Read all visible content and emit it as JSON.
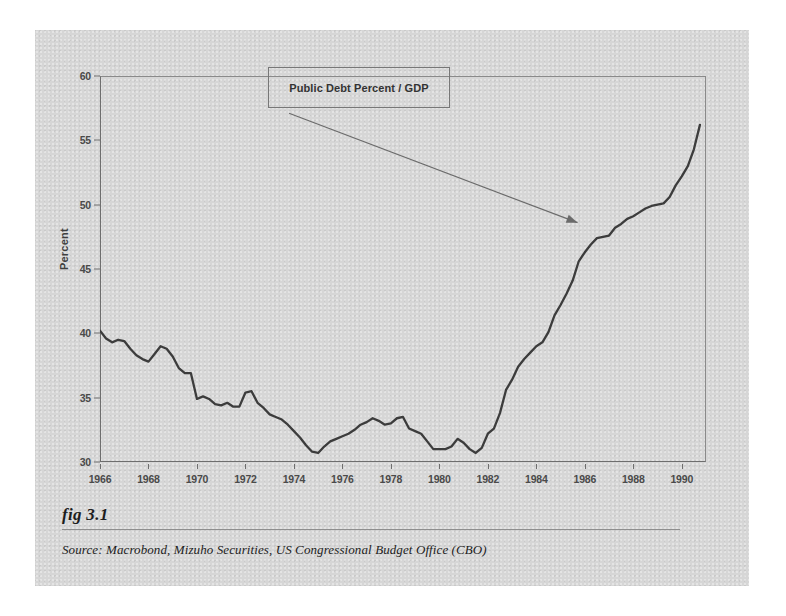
{
  "figure": {
    "number_label": "fig 3.1",
    "source_text": "Source:  Macrobond, Mizuho Securities, US Congressional Budget Office (CBO)",
    "panel_background": "#d6d6d6",
    "line_color": "#3c3c3c",
    "axis_color": "#6e6e6e"
  },
  "annotation": {
    "series_box_label": "Public Debt Percent / GDP",
    "arrow_name": "callout-arrow"
  },
  "chart_data": {
    "type": "line",
    "title": "",
    "subtitle": "",
    "xlabel": "",
    "ylabel": "Percent",
    "xlim": [
      1966.0,
      1991.0
    ],
    "ylim": [
      30,
      60
    ],
    "grid": false,
    "legend_position": "inside-top-center",
    "y_ticks": [
      30,
      35,
      40,
      45,
      50,
      55,
      60
    ],
    "y_tick_labels": [
      "30",
      "35",
      "40",
      "45",
      "50",
      "55",
      "60"
    ],
    "x_ticks": [
      1966,
      1968,
      1970,
      1972,
      1974,
      1976,
      1978,
      1980,
      1982,
      1984,
      1986,
      1988,
      1990
    ],
    "x_tick_labels": [
      "1966",
      "1968",
      "1970",
      "1972",
      "1974",
      "1976",
      "1978",
      "1980",
      "1982",
      "1984",
      "1986",
      "1988",
      "1990"
    ],
    "series": [
      {
        "name": "Public Debt Percent / GDP",
        "color": "#3c3c3c",
        "x": [
          1966.0,
          1966.25,
          1966.5,
          1966.75,
          1967.0,
          1967.25,
          1967.5,
          1967.75,
          1968.0,
          1968.25,
          1968.5,
          1968.75,
          1969.0,
          1969.25,
          1969.5,
          1969.75,
          1970.0,
          1970.25,
          1970.5,
          1970.75,
          1971.0,
          1971.25,
          1971.5,
          1971.75,
          1972.0,
          1972.25,
          1972.5,
          1972.75,
          1973.0,
          1973.25,
          1973.5,
          1973.75,
          1974.0,
          1974.25,
          1974.5,
          1974.75,
          1975.0,
          1975.25,
          1975.5,
          1975.75,
          1976.0,
          1976.25,
          1976.5,
          1976.75,
          1977.0,
          1977.25,
          1977.5,
          1977.75,
          1978.0,
          1978.25,
          1978.5,
          1978.75,
          1979.0,
          1979.25,
          1979.5,
          1979.75,
          1980.0,
          1980.25,
          1980.5,
          1980.75,
          1981.0,
          1981.25,
          1981.5,
          1981.75,
          1982.0,
          1982.25,
          1982.5,
          1982.75,
          1983.0,
          1983.25,
          1983.5,
          1983.75,
          1984.0,
          1984.25,
          1984.5,
          1984.75,
          1985.0,
          1985.25,
          1985.5,
          1985.75,
          1986.0,
          1986.25,
          1986.5,
          1986.75,
          1987.0,
          1987.25,
          1987.5,
          1987.75,
          1988.0,
          1988.25,
          1988.5,
          1988.75,
          1989.0,
          1989.25,
          1989.5,
          1989.75,
          1990.0,
          1990.25,
          1990.5,
          1990.75
        ],
        "y": [
          40.2,
          39.6,
          39.3,
          39.5,
          39.4,
          38.8,
          38.3,
          38.0,
          37.8,
          38.4,
          39.0,
          38.8,
          38.2,
          37.3,
          36.9,
          36.9,
          34.9,
          35.1,
          34.9,
          34.5,
          34.4,
          34.6,
          34.3,
          34.3,
          35.4,
          35.5,
          34.6,
          34.2,
          33.7,
          33.5,
          33.3,
          32.9,
          32.4,
          31.9,
          31.3,
          30.8,
          30.7,
          31.2,
          31.6,
          31.8,
          32.0,
          32.2,
          32.5,
          32.9,
          33.1,
          33.4,
          33.2,
          32.9,
          33.0,
          33.4,
          33.5,
          32.6,
          32.4,
          32.2,
          31.6,
          31.0,
          31.0,
          31.0,
          31.2,
          31.8,
          31.5,
          31.0,
          30.7,
          31.1,
          32.2,
          32.6,
          33.8,
          35.6,
          36.4,
          37.4,
          38.0,
          38.5,
          39.0,
          39.3,
          40.1,
          41.4,
          42.2,
          43.1,
          44.1,
          45.6,
          46.3,
          46.9,
          47.4,
          47.5,
          47.6,
          48.2,
          48.5,
          48.9,
          49.1,
          49.4,
          49.7,
          49.9,
          50.0,
          50.1,
          50.6,
          51.5,
          52.2,
          53.0,
          54.3,
          56.2
        ]
      }
    ],
    "annotations": [
      {
        "text": "Public Debt Percent / GDP",
        "type": "boxed-label-with-arrow",
        "arrow_from_x": 1973.8,
        "arrow_from_y": 57.1,
        "arrow_to_x": 1985.7,
        "arrow_to_y": 48.6
      }
    ]
  }
}
